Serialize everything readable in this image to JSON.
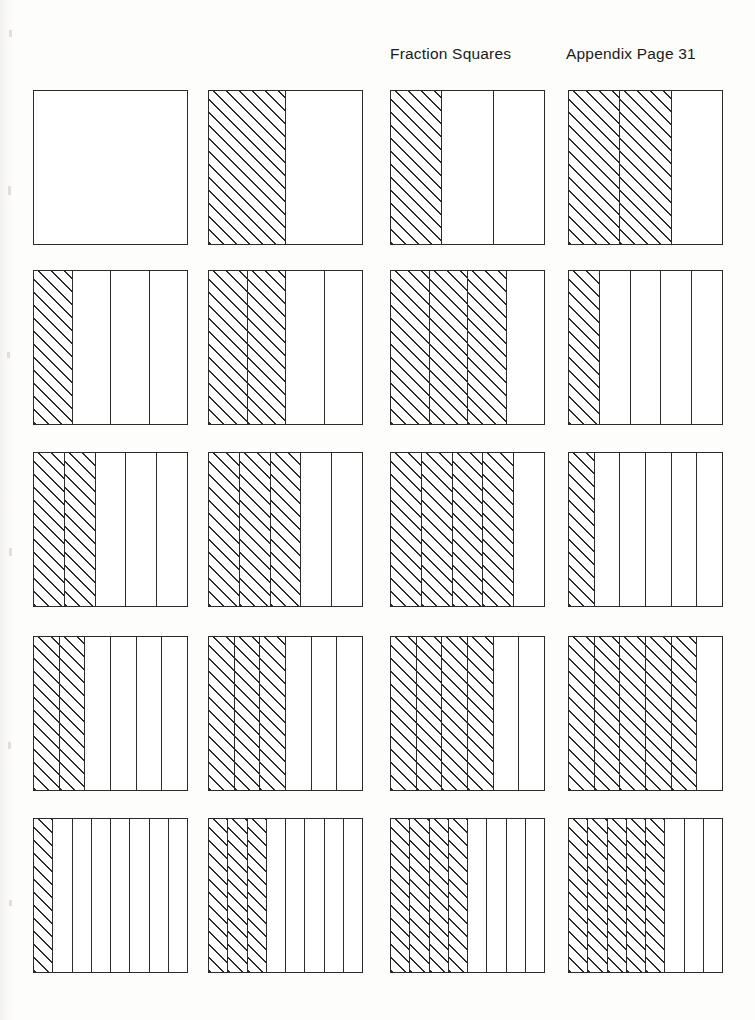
{
  "page": {
    "title": "Fraction Squares",
    "page_label": "Appendix Page 31",
    "background_color": "#ffffff",
    "ink_color": "#2b2b2b"
  },
  "chart_data": {
    "type": "bar",
    "title": "Fraction Squares",
    "subtitle": "Appendix Page 31",
    "xlabel": "",
    "ylabel": "",
    "grid": false,
    "legend": "none",
    "columns": 4,
    "rows": 5,
    "categories": [
      "1/1",
      "1/2",
      "1/3",
      "2/3",
      "1/4",
      "2/4",
      "3/4",
      "1/5",
      "2/5",
      "3/5",
      "4/5",
      "1/6",
      "2/6",
      "3/6",
      "4/6",
      "5/6",
      "1/8",
      "3/8",
      "4/8",
      "5/8"
    ],
    "values": [
      0,
      0.5,
      0.3333,
      0.6667,
      0.25,
      0.5,
      0.75,
      0.2,
      0.4,
      0.6,
      0.8,
      0.1667,
      0.3333,
      0.5,
      0.6667,
      0.8333,
      0.125,
      0.375,
      0.5,
      0.625
    ],
    "ylim": [
      0,
      1
    ],
    "squares": [
      {
        "row": 1,
        "col": 1,
        "parts": 1,
        "shaded": 0,
        "fraction": "0/1",
        "label": "whole-square-unshaded"
      },
      {
        "row": 1,
        "col": 2,
        "parts": 2,
        "shaded": 1,
        "fraction": "1/2",
        "label": "one-half"
      },
      {
        "row": 1,
        "col": 3,
        "parts": 3,
        "shaded": 1,
        "fraction": "1/3",
        "label": "one-third"
      },
      {
        "row": 1,
        "col": 4,
        "parts": 3,
        "shaded": 2,
        "fraction": "2/3",
        "label": "two-thirds"
      },
      {
        "row": 2,
        "col": 1,
        "parts": 4,
        "shaded": 1,
        "fraction": "1/4",
        "label": "one-fourth"
      },
      {
        "row": 2,
        "col": 2,
        "parts": 4,
        "shaded": 2,
        "fraction": "2/4",
        "label": "two-fourths"
      },
      {
        "row": 2,
        "col": 3,
        "parts": 4,
        "shaded": 3,
        "fraction": "3/4",
        "label": "three-fourths"
      },
      {
        "row": 2,
        "col": 4,
        "parts": 5,
        "shaded": 1,
        "fraction": "1/5",
        "label": "one-fifth"
      },
      {
        "row": 3,
        "col": 1,
        "parts": 5,
        "shaded": 2,
        "fraction": "2/5",
        "label": "two-fifths"
      },
      {
        "row": 3,
        "col": 2,
        "parts": 5,
        "shaded": 3,
        "fraction": "3/5",
        "label": "three-fifths"
      },
      {
        "row": 3,
        "col": 3,
        "parts": 5,
        "shaded": 4,
        "fraction": "4/5",
        "label": "four-fifths"
      },
      {
        "row": 3,
        "col": 4,
        "parts": 6,
        "shaded": 1,
        "fraction": "1/6",
        "label": "one-sixth"
      },
      {
        "row": 4,
        "col": 1,
        "parts": 6,
        "shaded": 2,
        "fraction": "2/6",
        "label": "two-sixths"
      },
      {
        "row": 4,
        "col": 2,
        "parts": 6,
        "shaded": 3,
        "fraction": "3/6",
        "label": "three-sixths"
      },
      {
        "row": 4,
        "col": 3,
        "parts": 6,
        "shaded": 4,
        "fraction": "4/6",
        "label": "four-sixths"
      },
      {
        "row": 4,
        "col": 4,
        "parts": 6,
        "shaded": 5,
        "fraction": "5/6",
        "label": "five-sixths"
      },
      {
        "row": 5,
        "col": 1,
        "parts": 8,
        "shaded": 1,
        "fraction": "1/8",
        "label": "one-eighth"
      },
      {
        "row": 5,
        "col": 2,
        "parts": 8,
        "shaded": 3,
        "fraction": "3/8",
        "label": "three-eighths"
      },
      {
        "row": 5,
        "col": 3,
        "parts": 8,
        "shaded": 4,
        "fraction": "4/8",
        "label": "four-eighths"
      },
      {
        "row": 5,
        "col": 4,
        "parts": 8,
        "shaded": 5,
        "fraction": "5/8",
        "label": "five-eighths"
      }
    ]
  },
  "layout": {
    "col_x": [
      33,
      208,
      390,
      568
    ],
    "row_y": [
      90,
      270,
      452,
      636,
      818
    ],
    "square_w": 155,
    "square_h": 155
  }
}
